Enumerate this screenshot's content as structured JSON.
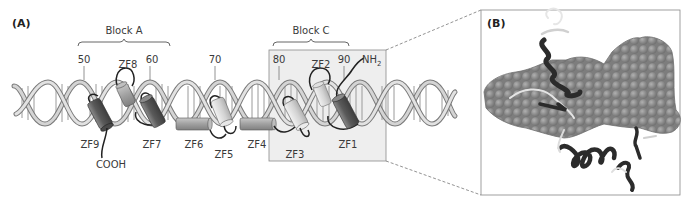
{
  "panel_a": {
    "label": "(A)",
    "blocks": [
      {
        "label": "Block A"
      },
      {
        "label": "Block C"
      }
    ],
    "positions": [
      "50",
      "60",
      "70",
      "80",
      "90"
    ],
    "termini": {
      "n": "NH",
      "n_sub": "2",
      "c": "COOH"
    },
    "fingers": {
      "zf1": "ZF1",
      "zf2": "ZF2",
      "zf3": "ZF3",
      "zf4": "ZF4",
      "zf5": "ZF5",
      "zf6": "ZF6",
      "zf7": "ZF7",
      "zf8": "ZF8",
      "zf9": "ZF9"
    }
  },
  "panel_b": {
    "label": "(B)"
  },
  "colors": {
    "dna": "#c9c9c9",
    "dna_edge": "#7a7a7a",
    "box_fill": "#eeeeee",
    "helix_dark": "#6b6b6b",
    "helix_light": "#d8d8d8",
    "space_fill": "#8a8a8a",
    "ribbon": "#2b2b2b"
  }
}
